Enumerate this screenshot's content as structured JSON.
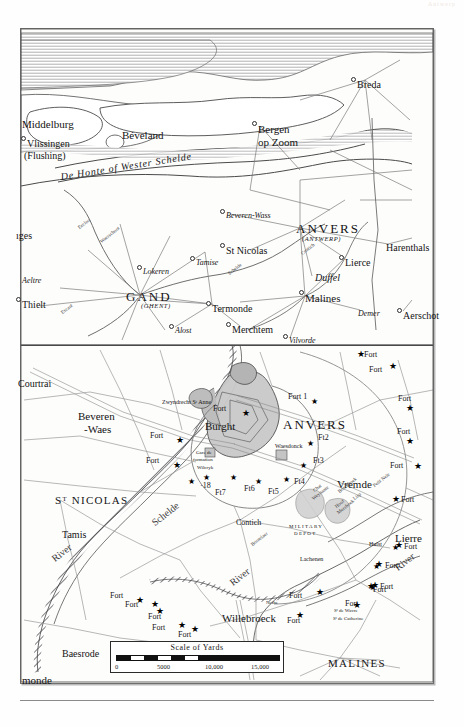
{
  "plate": {
    "corner_note": "Antwerp",
    "scale": {
      "title": "Scale of Yards",
      "ticks": [
        "0",
        "5000",
        "10,000",
        "15,000"
      ],
      "unit": "Yards"
    }
  },
  "upper_map": {
    "name": "regional-overview-scheldt-estuary",
    "water_label": "De Honte of Wester Schelde",
    "places": [
      {
        "name": "Middelburg",
        "x": 22,
        "y": 119,
        "style": "city",
        "dot": false
      },
      {
        "name": "Vlissingen",
        "x": 27,
        "y": 139,
        "style": "city2",
        "dot": true
      },
      {
        "name": "(Flushing)",
        "x": 24,
        "y": 151,
        "style": "city2",
        "dot": false
      },
      {
        "name": "Béveland",
        "x": 122,
        "y": 130,
        "style": "city",
        "dot": false
      },
      {
        "name": "Bergen",
        "x": 258,
        "y": 124,
        "style": "city",
        "dot": true
      },
      {
        "name": "op Zoom",
        "x": 258,
        "y": 137,
        "style": "city",
        "dot": false
      },
      {
        "name": "Breda",
        "x": 357,
        "y": 80,
        "style": "city2",
        "dot": true
      },
      {
        "name": "Beveren-Wass",
        "x": 226,
        "y": 212,
        "style": "ital small",
        "dot": true
      },
      {
        "name": "ANVERS",
        "x": 296,
        "y": 222,
        "style": "big",
        "dot": false
      },
      {
        "name": "(ANTWERP)",
        "x": 302,
        "y": 236,
        "style": "sub",
        "dot": false
      },
      {
        "name": "Harenthals",
        "x": 386,
        "y": 243,
        "style": "city2",
        "dot": false
      },
      {
        "name": "St Nicolas",
        "x": 226,
        "y": 246,
        "style": "city2",
        "dot": true
      },
      {
        "name": "Lierce",
        "x": 345,
        "y": 258,
        "style": "city2",
        "dot": true
      },
      {
        "name": "Duffel",
        "x": 315,
        "y": 273,
        "style": "ital city2",
        "dot": false
      },
      {
        "name": "Lokeren",
        "x": 143,
        "y": 268,
        "style": "ital small",
        "dot": true
      },
      {
        "name": "Tamise",
        "x": 196,
        "y": 259,
        "style": "ital small",
        "dot": true
      },
      {
        "name": "Aeltre",
        "x": 22,
        "y": 277,
        "style": "ital small",
        "dot": false
      },
      {
        "name": "Thielt",
        "x": 22,
        "y": 300,
        "style": "city2",
        "dot": true
      },
      {
        "name": "GAND",
        "x": 126,
        "y": 290,
        "style": "big",
        "dot": false
      },
      {
        "name": "(GHENT)",
        "x": 141,
        "y": 303,
        "style": "sub",
        "dot": false
      },
      {
        "name": "Malines",
        "x": 305,
        "y": 293,
        "style": "city",
        "dot": true
      },
      {
        "name": "Termonde",
        "x": 212,
        "y": 304,
        "style": "city2",
        "dot": true
      },
      {
        "name": "Demer",
        "x": 358,
        "y": 310,
        "style": "ital small",
        "dot": false
      },
      {
        "name": "Aerschot",
        "x": 403,
        "y": 311,
        "style": "city2",
        "dot": true
      },
      {
        "name": "Merchtem",
        "x": 232,
        "y": 325,
        "style": "city2",
        "dot": true
      },
      {
        "name": "Alost",
        "x": 175,
        "y": 327,
        "style": "ital small",
        "dot": true
      },
      {
        "name": "Vilvorde",
        "x": 289,
        "y": 337,
        "style": "ital small",
        "dot": true
      },
      {
        "name": "ıges",
        "x": 16,
        "y": 231,
        "style": "city2",
        "dot": false
      },
      {
        "name": "Eecloo",
        "x": 77,
        "y": 226,
        "style": "xtiny rot",
        "dot": false
      },
      {
        "name": "Waerschoot",
        "x": 99,
        "y": 240,
        "style": "xtiny rot",
        "dot": false
      },
      {
        "name": "Escaut",
        "x": 60,
        "y": 311,
        "style": "xtiny rot",
        "dot": false
      },
      {
        "name": "Schelde",
        "x": 227,
        "y": 272,
        "style": "xtiny rot",
        "dot": false
      },
      {
        "name": "Contich",
        "x": 300,
        "y": 252,
        "style": "xtiny rot",
        "dot": false
      }
    ]
  },
  "inset_map": {
    "name": "antwerp-fortifications-detail",
    "places": [
      {
        "name": "Courtrai",
        "x": 18,
        "y": 379,
        "style": "city2"
      },
      {
        "name": "Beveren",
        "x": 78,
        "y": 411,
        "style": "city"
      },
      {
        "name": "-Waes",
        "x": 84,
        "y": 424,
        "style": "city"
      },
      {
        "name": "Zwyndrecht Sᵗ Anne",
        "x": 162,
        "y": 399,
        "style": "tiny"
      },
      {
        "name": "Burght",
        "x": 205,
        "y": 421,
        "style": "city"
      },
      {
        "name": "ANVERS",
        "x": 283,
        "y": 418,
        "style": "big"
      },
      {
        "name": "Fort 1",
        "x": 288,
        "y": 393,
        "style": "fort"
      },
      {
        "name": "Ft2",
        "x": 318,
        "y": 434,
        "style": "fort"
      },
      {
        "name": "Ft3",
        "x": 313,
        "y": 457,
        "style": "fort"
      },
      {
        "name": "Waesdonck",
        "x": 275,
        "y": 443,
        "style": "tiny"
      },
      {
        "name": "Ft4",
        "x": 294,
        "y": 478,
        "style": "fort"
      },
      {
        "name": "Ft5",
        "x": 268,
        "y": 488,
        "style": "fort"
      },
      {
        "name": "Ft6",
        "x": 244,
        "y": 485,
        "style": "fort"
      },
      {
        "name": "Ft7",
        "x": 215,
        "y": 489,
        "style": "fort"
      },
      {
        "name": "·18",
        "x": 200,
        "y": 482,
        "style": "fort"
      },
      {
        "name": "Vremde",
        "x": 337,
        "y": 479,
        "style": "city"
      },
      {
        "name": "Contich",
        "x": 236,
        "y": 519,
        "style": "small"
      },
      {
        "name": "MILITARY",
        "x": 289,
        "y": 524,
        "style": "xtiny caps"
      },
      {
        "name": "DEPOT",
        "x": 294,
        "y": 531,
        "style": "xtiny caps"
      },
      {
        "name": "Lierre",
        "x": 395,
        "y": 533,
        "style": "city"
      },
      {
        "name": "Sᵀ NICOLAS",
        "x": 55,
        "y": 495,
        "style": "city caps"
      },
      {
        "name": "Tamis",
        "x": 62,
        "y": 530,
        "style": "city2"
      },
      {
        "name": "Baesrode",
        "x": 62,
        "y": 649,
        "style": "city2"
      },
      {
        "name": "Willebroeck",
        "x": 222,
        "y": 613,
        "style": "city"
      },
      {
        "name": "MALINES",
        "x": 328,
        "y": 658,
        "style": "city caps"
      },
      {
        "name": "monde",
        "x": 22,
        "y": 675,
        "style": "city"
      },
      {
        "name": "Gare de",
        "x": 196,
        "y": 450,
        "style": "xtiny"
      },
      {
        "name": "formation",
        "x": 193,
        "y": 457,
        "style": "xtiny"
      },
      {
        "name": "Wilcryk",
        "x": 197,
        "y": 465,
        "style": "xtiny"
      },
      {
        "name": "Lachenen",
        "x": 300,
        "y": 556,
        "style": "tiny"
      },
      {
        "name": "Bornelaer",
        "x": 250,
        "y": 543,
        "style": "xtiny rot"
      },
      {
        "name": "Hulst",
        "x": 369,
        "y": 541,
        "style": "tiny"
      },
      {
        "name": "Chat",
        "x": 312,
        "y": 489,
        "style": "xtiny rot"
      },
      {
        "name": "Weynante",
        "x": 311,
        "y": 497,
        "style": "xtiny rot"
      },
      {
        "name": "Boschhoek",
        "x": 337,
        "y": 490,
        "style": "xtiny rot"
      },
      {
        "name": "Lisp",
        "x": 352,
        "y": 497,
        "style": "xtiny rot"
      },
      {
        "name": "Hoof",
        "x": 334,
        "y": 505,
        "style": "xtiny rot"
      },
      {
        "name": "Meerhoek",
        "x": 336,
        "y": 511,
        "style": "xtiny rot"
      },
      {
        "name": "Petit Nele",
        "x": 372,
        "y": 484,
        "style": "xtiny rot"
      },
      {
        "name": "Nethe",
        "x": 266,
        "y": 600,
        "style": "xtiny"
      },
      {
        "name": "Sᵗ de Wavre",
        "x": 334,
        "y": 608,
        "style": "xtiny"
      },
      {
        "name": "Sᵗ de Catherine",
        "x": 333,
        "y": 616,
        "style": "xtiny"
      },
      {
        "name": "Schelde",
        "x": 150,
        "y": 520,
        "style": "city2 rot"
      },
      {
        "name": "River",
        "x": 228,
        "y": 580,
        "style": "city2 rot"
      },
      {
        "name": "River",
        "x": 50,
        "y": 556,
        "style": "city2 rot"
      },
      {
        "name": "River",
        "x": 393,
        "y": 565,
        "style": "city2 rot"
      }
    ],
    "forts": [
      {
        "label": "Fort",
        "lx": 213,
        "ly": 405,
        "sx": 242,
        "sy": 409
      },
      {
        "label": "Fort",
        "lx": 150,
        "ly": 432,
        "sx": 176,
        "sy": 436
      },
      {
        "label": "Fort",
        "lx": 146,
        "ly": 457,
        "sx": 173,
        "sy": 461
      },
      {
        "label": "Fort",
        "lx": 364,
        "ly": 351,
        "sx": 357,
        "sy": 350
      },
      {
        "label": "Fort",
        "lx": 369,
        "ly": 366,
        "sx": 389,
        "sy": 362
      },
      {
        "label": "Fort",
        "lx": 398,
        "ly": 395,
        "sx": 406,
        "sy": 404
      },
      {
        "label": "Fort",
        "lx": 397,
        "ly": 428,
        "sx": 406,
        "sy": 437
      },
      {
        "label": "Fort",
        "lx": 390,
        "ly": 462,
        "sx": 414,
        "sy": 462
      },
      {
        "label": "Fort",
        "lx": 401,
        "ly": 496,
        "sx": 392,
        "sy": 495
      },
      {
        "label": "Fort",
        "lx": 404,
        "ly": 543,
        "sx": 395,
        "sy": 541
      },
      {
        "label": "Fort",
        "lx": 385,
        "ly": 562,
        "sx": 375,
        "sy": 560
      },
      {
        "label": "Fort",
        "lx": 380,
        "ly": 583,
        "sx": 371,
        "sy": 581
      },
      {
        "label": "Fort",
        "lx": 110,
        "ly": 592,
        "sx": 136,
        "sy": 596
      },
      {
        "label": "Fort",
        "lx": 125,
        "ly": 601,
        "sx": 151,
        "sy": 600
      },
      {
        "label": "Fort",
        "lx": 148,
        "ly": 613,
        "sx": 156,
        "sy": 607
      },
      {
        "label": "Fort",
        "lx": 152,
        "ly": 624,
        "sx": 178,
        "sy": 621
      },
      {
        "label": "Fort",
        "lx": 178,
        "ly": 631,
        "sx": 191,
        "sy": 625
      },
      {
        "label": "Fort",
        "lx": 287,
        "ly": 617,
        "sx": 296,
        "sy": 611
      },
      {
        "label": "Fort",
        "lx": 289,
        "ly": 592,
        "sx": 316,
        "sy": 588
      },
      {
        "label": "Fort",
        "lx": 345,
        "ly": 600,
        "sx": 353,
        "sy": 601
      },
      {
        "label": "Fort",
        "lx": 373,
        "ly": 586,
        "sx": 367,
        "sy": 582
      }
    ]
  }
}
